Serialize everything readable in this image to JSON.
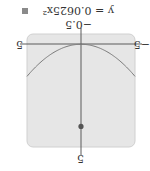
{
  "chart_data": {
    "type": "line",
    "title": "",
    "equation": "y = 0.0625x²",
    "function": {
      "a": 0.0625,
      "form": "y = a*x^2"
    },
    "xlim": [
      -5,
      5
    ],
    "ylim": [
      -0.5,
      5
    ],
    "tick_labels": {
      "x_min": "−5",
      "x_max": "5",
      "y_min": "−0.5",
      "y_max": "5"
    },
    "series": [
      {
        "name": "y = 0.0625x²",
        "x": [
          -5,
          -4,
          -3,
          -2,
          -1,
          0,
          1,
          2,
          3,
          4,
          5
        ],
        "values": [
          1.5625,
          1,
          0.5625,
          0.25,
          0.0625,
          0,
          0.0625,
          0.25,
          0.5625,
          1,
          1.5625
        ]
      }
    ],
    "points": [
      {
        "label": "focus",
        "x": 0,
        "y": 4
      }
    ],
    "grid": false,
    "legend_position": "top-right",
    "orientation_note": "image displayed rotated 180°",
    "colors": {
      "plot_bg": "#e6e6e6",
      "plot_border": "#cfcfcf",
      "axis": "#555555",
      "curve": "#7a7a7a",
      "point": "#555555",
      "legend_swatch": "#8a8a8a"
    }
  },
  "labels": {
    "equation": "y = 0.0625x²",
    "y_min": "−0.5",
    "y_max": "5",
    "x_min": "−5",
    "x_max": "5"
  }
}
